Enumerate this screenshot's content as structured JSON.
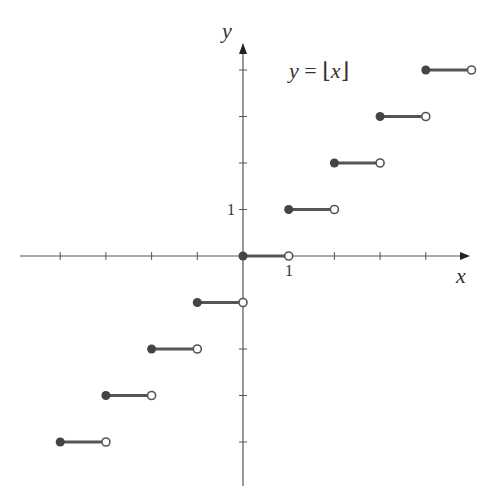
{
  "chart_data": {
    "type": "line",
    "subtype": "step",
    "title": "y = ⌊x⌋",
    "function": "floor",
    "xlabel": "x",
    "ylabel": "y",
    "xlim": [
      -5,
      5
    ],
    "ylim": [
      -5,
      5
    ],
    "x_tick_labels": [
      {
        "value": 1,
        "label": "1"
      }
    ],
    "y_tick_labels": [
      {
        "value": 1,
        "label": "1"
      }
    ],
    "x_ticks": [
      -4,
      -3,
      -2,
      -1,
      1,
      2,
      3,
      4
    ],
    "y_ticks": [
      -4,
      -3,
      -2,
      -1,
      1,
      2,
      3,
      4
    ],
    "grid": false,
    "legend": null,
    "segments": [
      {
        "x_start": -4,
        "x_end": -3,
        "y": -4,
        "closed_left": true,
        "open_right": true
      },
      {
        "x_start": -3,
        "x_end": -2,
        "y": -3,
        "closed_left": true,
        "open_right": true
      },
      {
        "x_start": -2,
        "x_end": -1,
        "y": -2,
        "closed_left": true,
        "open_right": true
      },
      {
        "x_start": -1,
        "x_end": 0,
        "y": -1,
        "closed_left": true,
        "open_right": true
      },
      {
        "x_start": 0,
        "x_end": 1,
        "y": 0,
        "closed_left": true,
        "open_right": true
      },
      {
        "x_start": 1,
        "x_end": 2,
        "y": 1,
        "closed_left": true,
        "open_right": true
      },
      {
        "x_start": 2,
        "x_end": 3,
        "y": 2,
        "closed_left": true,
        "open_right": true
      },
      {
        "x_start": 3,
        "x_end": 4,
        "y": 3,
        "closed_left": true,
        "open_right": true
      },
      {
        "x_start": 4,
        "x_end": 5,
        "y": 4,
        "closed_left": true,
        "open_right": true
      }
    ],
    "colors": {
      "axis": "#555555",
      "segment": "#555555",
      "closed_dot": "#444444",
      "open_dot_fill": "#ffffff",
      "open_dot_stroke": "#555555"
    }
  },
  "labels": {
    "x_axis": "x",
    "y_axis": "y",
    "x_tick_1": "1",
    "y_tick_1": "1",
    "title_lhs": "y",
    "title_eq": " = ",
    "title_open": "⌊",
    "title_var": "x",
    "title_close": "⌋"
  }
}
